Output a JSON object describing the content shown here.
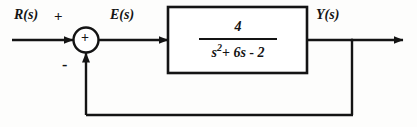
{
  "diagram": {
    "type": "control-system-block-diagram",
    "colors": {
      "line": "#141414",
      "background": "#fdfdfc",
      "text": "#141414"
    },
    "signals": {
      "input_label": "R(s)",
      "error_label": "E(s)",
      "output_label": "Y(s)"
    },
    "summing_junction": {
      "name": "summing-junction",
      "inner_symbol": "+",
      "input_sign": "+",
      "feedback_sign": "-"
    },
    "transfer_function": {
      "numerator": "4",
      "denominator_variable": "s",
      "denominator_exponent": "2",
      "denominator_op1": "+",
      "denominator_term2": "6s",
      "denominator_op2": "-",
      "denominator_term3": "2",
      "denominator_full": "s2 + 6s - 2",
      "expression": "4 / (s^2 + 6s - 2)"
    },
    "feedback_path": {
      "name": "unity-feedback",
      "gain": "1"
    }
  }
}
